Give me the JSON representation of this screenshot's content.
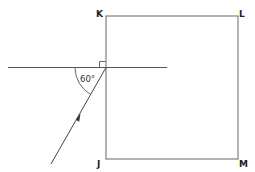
{
  "diagram": {
    "type": "geometry-optics",
    "vertices": [
      {
        "id": "K",
        "label": "K"
      },
      {
        "id": "L",
        "label": "L"
      },
      {
        "id": "M",
        "label": "M"
      },
      {
        "id": "J",
        "label": "J"
      }
    ],
    "angle": {
      "label": "60°",
      "value": 60,
      "unit": "degrees"
    },
    "right_angle_marker": true,
    "ray_direction": "upward-right toward point on KJ",
    "colors": {
      "stroke": "#555555",
      "text": "#222222",
      "background": "#ffffff"
    }
  }
}
